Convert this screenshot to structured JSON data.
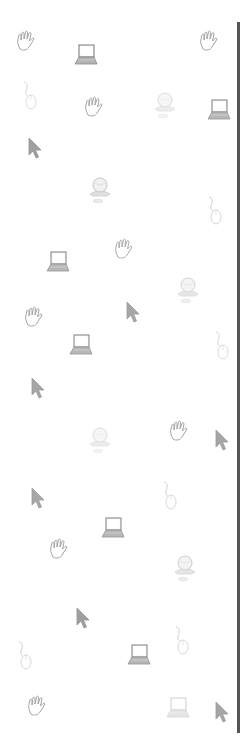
{
  "background": {
    "color": "#ffffff",
    "pattern_icons": [
      {
        "type": "hand-icon",
        "x": 27,
        "y": 42,
        "opacity": 0.6
      },
      {
        "type": "laptop-icon",
        "x": 85,
        "y": 55,
        "opacity": 0.75
      },
      {
        "type": "hand-icon",
        "x": 210,
        "y": 42,
        "opacity": 0.6
      },
      {
        "type": "mouse-icon",
        "x": 30,
        "y": 95,
        "opacity": 0.35
      },
      {
        "type": "hand-icon",
        "x": 95,
        "y": 108,
        "opacity": 0.6
      },
      {
        "type": "globe-computer-icon",
        "x": 165,
        "y": 105,
        "opacity": 0.35
      },
      {
        "type": "laptop-icon",
        "x": 218,
        "y": 110,
        "opacity": 0.7
      },
      {
        "type": "cursor-icon",
        "x": 35,
        "y": 148,
        "opacity": 0.7
      },
      {
        "type": "globe-computer-icon",
        "x": 100,
        "y": 190,
        "opacity": 0.6
      },
      {
        "type": "mouse-icon",
        "x": 215,
        "y": 210,
        "opacity": 0.4
      },
      {
        "type": "laptop-icon",
        "x": 57,
        "y": 262,
        "opacity": 0.7
      },
      {
        "type": "hand-icon",
        "x": 125,
        "y": 250,
        "opacity": 0.55
      },
      {
        "type": "globe-computer-icon",
        "x": 188,
        "y": 290,
        "opacity": 0.45
      },
      {
        "type": "hand-icon",
        "x": 35,
        "y": 318,
        "opacity": 0.6
      },
      {
        "type": "cursor-icon",
        "x": 133,
        "y": 312,
        "opacity": 0.65
      },
      {
        "type": "laptop-icon",
        "x": 80,
        "y": 345,
        "opacity": 0.7
      },
      {
        "type": "mouse-icon",
        "x": 222,
        "y": 345,
        "opacity": 0.35
      },
      {
        "type": "cursor-icon",
        "x": 38,
        "y": 388,
        "opacity": 0.65
      },
      {
        "type": "globe-computer-icon",
        "x": 100,
        "y": 440,
        "opacity": 0.35
      },
      {
        "type": "hand-icon",
        "x": 180,
        "y": 432,
        "opacity": 0.6
      },
      {
        "type": "cursor-icon",
        "x": 222,
        "y": 440,
        "opacity": 0.65
      },
      {
        "type": "cursor-icon",
        "x": 38,
        "y": 498,
        "opacity": 0.65
      },
      {
        "type": "mouse-icon",
        "x": 170,
        "y": 495,
        "opacity": 0.4
      },
      {
        "type": "laptop-icon",
        "x": 112,
        "y": 528,
        "opacity": 0.7
      },
      {
        "type": "hand-icon",
        "x": 60,
        "y": 550,
        "opacity": 0.6
      },
      {
        "type": "globe-computer-icon",
        "x": 185,
        "y": 568,
        "opacity": 0.5
      },
      {
        "type": "cursor-icon",
        "x": 83,
        "y": 618,
        "opacity": 0.7
      },
      {
        "type": "mouse-icon",
        "x": 25,
        "y": 655,
        "opacity": 0.4
      },
      {
        "type": "mouse-icon",
        "x": 182,
        "y": 640,
        "opacity": 0.4
      },
      {
        "type": "laptop-icon",
        "x": 138,
        "y": 655,
        "opacity": 0.7
      },
      {
        "type": "hand-icon",
        "x": 38,
        "y": 707,
        "opacity": 0.6
      },
      {
        "type": "laptop-icon",
        "x": 177,
        "y": 708,
        "opacity": 0.25
      },
      {
        "type": "cursor-icon",
        "x": 222,
        "y": 712,
        "opacity": 0.65
      }
    ]
  },
  "divider": {
    "color": "#555555"
  }
}
